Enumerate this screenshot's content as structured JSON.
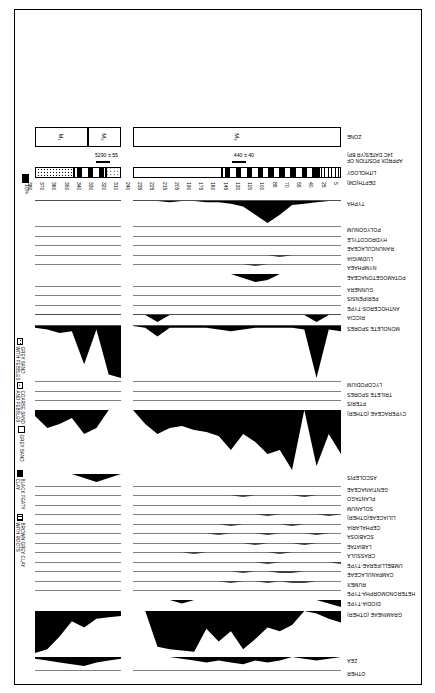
{
  "figure": {
    "type": "pollen-percentage-diagram",
    "orientation_note": "printed upside-down (rotated 180 degrees)",
    "row_headers": {
      "depth": "DEPTH(CM)",
      "lithology": "LITHOLOGY",
      "dates": "APPROX POSITION OF\n14C DATES(YR BP)",
      "zone": "ZONE"
    },
    "scale_label": "10%"
  },
  "axis": {
    "depth_label": "DEPTH(CM)",
    "depth_ticks": [
      5,
      25,
      40,
      55,
      70,
      85,
      100,
      115,
      130,
      145,
      160,
      175,
      190,
      205,
      215,
      225,
      235,
      240,
      310,
      320,
      330,
      340,
      350,
      360,
      370,
      380
    ],
    "depth_ticks_core_a": [
      5,
      25,
      40,
      55,
      70,
      85,
      100,
      115,
      130,
      145,
      160,
      175,
      190,
      205,
      215,
      225,
      235,
      240
    ],
    "depth_ticks_core_b": [
      310,
      320,
      330,
      340,
      350,
      360,
      370,
      380
    ]
  },
  "dates": [
    {
      "value": "440 ± 40",
      "depth": 120
    },
    {
      "value": "5290 ± 55",
      "depth": 325
    }
  ],
  "zones": [
    {
      "label": "M₃",
      "from": 5,
      "to": 240
    },
    {
      "label": "M₂",
      "from": 310,
      "to": 337
    },
    {
      "label": "M₁",
      "from": 337,
      "to": 380
    }
  ],
  "lithology_legend": [
    {
      "key": "brown-grey-clay-with-roots",
      "label": "BROWN GREY CLAY\nWITH ROOTS",
      "label_l1": "BROWN GREY CLAY",
      "label_l2": "WITH ROOTS"
    },
    {
      "key": "black-peaty-clay",
      "label": "BLACK PEATY\nCLAY",
      "label_l1": "BLACK PEATY",
      "label_l2": "CLAY"
    },
    {
      "key": "grey-sand",
      "label": "GREY SAND",
      "label_l1": "GREY SAND",
      "label_l2": ""
    },
    {
      "key": "coarse-sand-and-pebbles",
      "label": "COARSE SAND\nAND PEBBLES",
      "label_l1": "COARSE SAND",
      "label_l2": "AND PEBBLES"
    },
    {
      "key": "grey-sand-with-pebbles",
      "label": "GREY SAND\nWITH PEBBLES",
      "label_l1": "GREY SAND",
      "label_l2": "WITH PEBBLES"
    }
  ],
  "lithology_strip": [
    {
      "from": 5,
      "to": 30,
      "unit": "brown-grey-clay-with-roots"
    },
    {
      "from": 30,
      "to": 140,
      "unit": "black-peaty-clay"
    },
    {
      "from": 140,
      "to": 240,
      "unit": "grey-sand"
    },
    {
      "from": 310,
      "to": 322,
      "unit": "coarse-sand-and-pebbles"
    },
    {
      "from": 322,
      "to": 348,
      "unit": "black-peaty-clay"
    },
    {
      "from": 348,
      "to": 380,
      "unit": "grey-sand-with-pebbles"
    }
  ],
  "chart_data": {
    "type": "area",
    "xlabel": "DEPTH(CM)",
    "ylabel": "percentage",
    "x_core_a": [
      5,
      25,
      40,
      55,
      70,
      85,
      100,
      115,
      130,
      145,
      160,
      175,
      190,
      205,
      215,
      225,
      235,
      240
    ],
    "x_core_b": [
      310,
      320,
      330,
      340,
      350,
      360,
      370,
      380
    ],
    "scale": "10%",
    "taxa": [
      {
        "name": "OTHER",
        "core_a": [
          0,
          0,
          0,
          0,
          0,
          0,
          0,
          0,
          0,
          0,
          0,
          0,
          0,
          0,
          0,
          0,
          0,
          0
        ],
        "core_b": [
          0,
          0,
          0,
          0,
          0,
          0,
          0,
          0
        ]
      },
      {
        "name": "ZEA",
        "core_a": [
          0,
          1,
          2,
          1,
          0,
          2,
          3,
          2,
          4,
          3,
          2,
          3,
          2,
          1,
          0,
          0,
          0,
          0
        ],
        "core_b": [
          1,
          2,
          3,
          5,
          4,
          3,
          2,
          1
        ]
      },
      {
        "name": "GRAMINEAE (OTHER)",
        "core_a": [
          9,
          6,
          2,
          0,
          11,
          16,
          13,
          22,
          30,
          16,
          24,
          14,
          32,
          31,
          30,
          28,
          0,
          0
        ],
        "core_b": [
          4,
          5,
          6,
          13,
          8,
          20,
          30,
          33
        ]
      },
      {
        "name": "DIODIA-TYPE",
        "core_a": [
          2,
          1,
          0,
          0,
          0,
          0,
          0,
          0,
          0,
          0,
          0,
          0,
          0,
          1,
          0,
          0,
          0,
          0
        ],
        "core_b": [
          0,
          0,
          0,
          0,
          0,
          0,
          0,
          0
        ]
      },
      {
        "name": "HETERONOMORPHA-TYPE",
        "core_a": [
          0,
          0,
          0,
          0,
          0,
          0,
          0,
          0,
          0,
          0,
          0,
          0,
          0,
          0,
          0,
          0,
          0,
          0
        ],
        "core_b": [
          0,
          0,
          0,
          0,
          0,
          0,
          0,
          0
        ]
      },
      {
        "name": "RUMEX",
        "core_a": [
          0,
          0,
          0,
          1,
          1,
          0,
          1,
          0,
          0,
          1,
          0,
          0,
          0,
          0,
          0,
          0,
          0,
          0
        ],
        "core_b": [
          0,
          0,
          0,
          0,
          0,
          0,
          0,
          0
        ]
      },
      {
        "name": "CAMPANULACEAE",
        "core_a": [
          0,
          0,
          0,
          0,
          1,
          1,
          0,
          0,
          1,
          0,
          0,
          0,
          0,
          0,
          0,
          0,
          0,
          0
        ],
        "core_b": [
          0,
          0,
          0,
          0,
          0,
          0,
          0,
          0
        ]
      },
      {
        "name": "UMBELLIFERAE-TYPE",
        "core_a": [
          1,
          0,
          0,
          0,
          0,
          0,
          1,
          0,
          0,
          0,
          0,
          0,
          0,
          0,
          0,
          0,
          0,
          0
        ],
        "core_b": [
          0,
          0,
          0,
          0,
          0,
          0,
          0,
          0
        ]
      },
      {
        "name": "CRASSULA",
        "core_a": [
          0,
          0,
          0,
          0,
          0,
          1,
          0,
          0,
          0,
          0,
          0,
          0,
          1,
          0,
          0,
          0,
          0,
          0
        ],
        "core_b": [
          0,
          0,
          0,
          0,
          0,
          0,
          0,
          0
        ]
      },
      {
        "name": "LABIATAE",
        "core_a": [
          0,
          0,
          0,
          1,
          0,
          0,
          0,
          1,
          0,
          0,
          0,
          0,
          0,
          0,
          0,
          0,
          0,
          0
        ],
        "core_b": [
          0,
          0,
          0,
          0,
          0,
          0,
          0,
          0
        ]
      },
      {
        "name": "SCABIOSA",
        "core_a": [
          0,
          0,
          1,
          0,
          0,
          0,
          1,
          0,
          0,
          0,
          1,
          0,
          0,
          0,
          0,
          0,
          0,
          0
        ],
        "core_b": [
          0,
          0,
          0,
          0,
          0,
          0,
          0,
          0
        ]
      },
      {
        "name": "CEPHALARIA",
        "core_a": [
          0,
          0,
          0,
          0,
          1,
          0,
          0,
          0,
          0,
          1,
          0,
          0,
          0,
          0,
          0,
          0,
          0,
          0
        ],
        "core_b": [
          0,
          0,
          0,
          0,
          0,
          0,
          0,
          0
        ]
      },
      {
        "name": "LILIACEAE(OTHER)",
        "core_a": [
          0,
          1,
          0,
          0,
          0,
          0,
          1,
          0,
          0,
          0,
          0,
          0,
          0,
          0,
          0,
          0,
          0,
          0
        ],
        "core_b": [
          0,
          0,
          0,
          0,
          0,
          0,
          0,
          0
        ]
      },
      {
        "name": "SOLANUM",
        "core_a": [
          0,
          0,
          0,
          0,
          0,
          0,
          0,
          0,
          0,
          0,
          0,
          0,
          0,
          0,
          0,
          0,
          0,
          0
        ],
        "core_b": [
          0,
          0,
          0,
          0,
          0,
          0,
          0,
          0
        ]
      },
      {
        "name": "PLANTAGO",
        "core_a": [
          0,
          0,
          0,
          1,
          0,
          0,
          0,
          0,
          1,
          0,
          0,
          0,
          0,
          0,
          0,
          0,
          0,
          0
        ],
        "core_b": [
          0,
          0,
          0,
          0,
          0,
          0,
          0,
          0
        ]
      },
      {
        "name": "GENTIANACEAE",
        "core_a": [
          0,
          0,
          0,
          0,
          0,
          0,
          0,
          0,
          0,
          0,
          0,
          0,
          0,
          0,
          0,
          0,
          0,
          0
        ],
        "core_b": [
          0,
          0,
          0,
          0,
          0,
          0,
          0,
          0
        ]
      },
      {
        "name": "ASCOLEPIS",
        "core_a": [
          0,
          0,
          0,
          0,
          0,
          0,
          0,
          0,
          0,
          0,
          0,
          0,
          0,
          0,
          0,
          0,
          0,
          0
        ],
        "core_b": [
          0,
          2,
          4,
          2,
          0,
          0,
          0,
          0
        ]
      },
      {
        "name": "CYPERACEAE (OTHER)",
        "core_a": [
          22,
          12,
          28,
          0,
          30,
          20,
          22,
          16,
          12,
          20,
          13,
          11,
          10,
          8,
          9,
          12,
          7,
          0
        ],
        "core_b": [
          0,
          0,
          9,
          12,
          4,
          7,
          9,
          3
        ]
      },
      {
        "name": "PTERIS",
        "core_a": [
          0,
          0,
          0,
          0,
          0,
          0,
          0,
          0,
          0,
          0,
          0,
          0,
          0,
          0,
          0,
          0,
          0,
          0
        ],
        "core_b": [
          0,
          0,
          0,
          0,
          0,
          0,
          0,
          0
        ]
      },
      {
        "name": "TRILETE SPORES",
        "core_a": [
          0,
          0,
          0,
          0,
          0,
          0,
          0,
          0,
          0,
          0,
          0,
          0,
          0,
          0,
          0,
          0,
          0,
          0
        ],
        "core_b": [
          0,
          0,
          0,
          0,
          0,
          0,
          0,
          0
        ]
      },
      {
        "name": "LYCOPODIUM",
        "core_a": [
          0,
          0,
          0,
          0,
          0,
          0,
          0,
          0,
          0,
          0,
          0,
          0,
          0,
          0,
          0,
          0,
          0,
          0
        ],
        "core_b": [
          0,
          0,
          0,
          0,
          0,
          0,
          0,
          0
        ]
      },
      {
        "name": "MONOLETE SPORES",
        "core_a": [
          3,
          2,
          30,
          2,
          1,
          1,
          1,
          1,
          2,
          3,
          2,
          1,
          1,
          1,
          1,
          6,
          1,
          0
        ],
        "core_b": [
          30,
          28,
          2,
          22,
          3,
          4,
          2,
          1
        ]
      },
      {
        "name": "RICCIA",
        "core_a": [
          0,
          0,
          1,
          0,
          0,
          0,
          0,
          0,
          0,
          0,
          0,
          0,
          0,
          0,
          0,
          1,
          0,
          0
        ],
        "core_b": [
          0,
          0,
          0,
          0,
          0,
          0,
          0,
          0
        ]
      },
      {
        "name": "ANTHOCEROS-TYPE",
        "core_a": [
          0,
          0,
          0,
          0,
          0,
          0,
          0,
          0,
          0,
          0,
          0,
          0,
          0,
          0,
          0,
          0,
          0,
          0
        ],
        "core_b": [
          0,
          0,
          0,
          0,
          0,
          0,
          0,
          0
        ]
      },
      {
        "name": "PERIPENSIS",
        "core_a": [
          0,
          0,
          0,
          0,
          0,
          0,
          0,
          0,
          0,
          0,
          0,
          0,
          0,
          0,
          0,
          0,
          0,
          0
        ],
        "core_b": [
          0,
          0,
          0,
          0,
          0,
          0,
          0,
          0
        ]
      },
      {
        "name": "GUNNERA",
        "core_a": [
          0,
          0,
          0,
          0,
          0,
          0,
          0,
          0,
          0,
          0,
          0,
          0,
          0,
          0,
          0,
          0,
          0,
          0
        ],
        "core_b": [
          0,
          0,
          0,
          0,
          0,
          0,
          0,
          0
        ]
      },
      {
        "name": "POTAMOGETONACEAE",
        "core_a": [
          0,
          0,
          0,
          0,
          0,
          0,
          3,
          4,
          2,
          0,
          0,
          0,
          0,
          0,
          0,
          0,
          0,
          0
        ],
        "core_b": [
          0,
          0,
          0,
          0,
          0,
          0,
          0,
          0
        ]
      },
      {
        "name": "NYMPHAEA",
        "core_a": [
          0,
          0,
          0,
          0,
          0,
          0,
          0,
          1,
          0,
          0,
          0,
          0,
          0,
          0,
          0,
          0,
          0,
          0
        ],
        "core_b": [
          0,
          0,
          0,
          0,
          0,
          0,
          0,
          0
        ]
      },
      {
        "name": "LUDWIGIA",
        "core_a": [
          0,
          0,
          0,
          0,
          0,
          1,
          0,
          0,
          0,
          0,
          0,
          0,
          0,
          0,
          0,
          0,
          0,
          0
        ],
        "core_b": [
          0,
          0,
          0,
          0,
          0,
          0,
          0,
          0
        ]
      },
      {
        "name": "RANUNCULACEAE",
        "core_a": [
          0,
          0,
          0,
          0,
          0,
          0,
          0,
          0,
          0,
          0,
          0,
          0,
          0,
          0,
          0,
          0,
          0,
          0
        ],
        "core_b": [
          0,
          0,
          0,
          0,
          0,
          0,
          0,
          0
        ]
      },
      {
        "name": "HYDROCOTYLE",
        "core_a": [
          0,
          0,
          0,
          0,
          0,
          0,
          0,
          0,
          0,
          0,
          0,
          0,
          0,
          0,
          0,
          0,
          0,
          0
        ],
        "core_b": [
          0,
          0,
          0,
          0,
          0,
          0,
          0,
          0
        ]
      },
      {
        "name": "POLYGONUM",
        "core_a": [
          0,
          0,
          0,
          0,
          0,
          0,
          0,
          0,
          0,
          0,
          0,
          0,
          0,
          0,
          0,
          0,
          0,
          0
        ],
        "core_b": [
          0,
          0,
          0,
          0,
          0,
          0,
          0,
          0
        ]
      },
      {
        "name": "TYPHA",
        "core_a": [
          0,
          0,
          1,
          2,
          3,
          10,
          16,
          10,
          4,
          2,
          1,
          1,
          0,
          0,
          1,
          0,
          0,
          0
        ],
        "core_b": [
          0,
          0,
          0,
          0,
          0,
          0,
          0,
          0
        ]
      }
    ]
  }
}
